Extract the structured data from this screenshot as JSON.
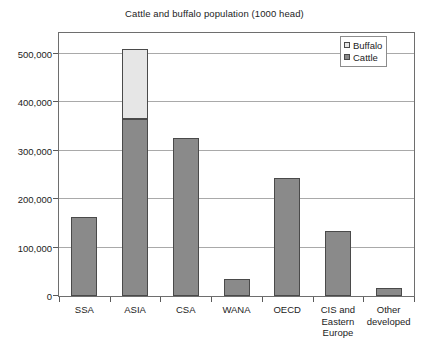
{
  "chart_data": {
    "type": "bar",
    "title": "Cattle and buffalo population (1000 head)",
    "xlabel": "",
    "ylabel": "",
    "ylim": [
      0,
      500000
    ],
    "ytick_labels": [
      "500,000",
      "400,000",
      "300,000",
      "200,000",
      "100,000",
      "0"
    ],
    "ytick_values": [
      500000,
      400000,
      300000,
      200000,
      100000,
      0
    ],
    "grid": true,
    "stacked": true,
    "legend_position": "top-right",
    "categories": [
      "SSA",
      "ASIA",
      "CSA",
      "WANA",
      "OECD",
      "CIS and Eastern Europe",
      "Other developed"
    ],
    "category_lines": [
      [
        "SSA"
      ],
      [
        "ASIA"
      ],
      [
        "CSA"
      ],
      [
        "WANA"
      ],
      [
        "OECD"
      ],
      [
        "CIS and",
        "Eastern",
        "Europe"
      ],
      [
        "Other",
        "developed"
      ]
    ],
    "series": [
      {
        "name": "Cattle",
        "color": "#8a8a8a",
        "values": [
          163000,
          365000,
          327000,
          35000,
          244000,
          134000,
          17000
        ]
      },
      {
        "name": "Buffalo",
        "color": "#e6e6e6",
        "values": [
          0,
          145000,
          0,
          0,
          0,
          0,
          0
        ]
      }
    ]
  },
  "legend": {
    "items": [
      {
        "label": "Buffalo",
        "color": "#e6e6e6"
      },
      {
        "label": "Cattle",
        "color": "#8a8a8a"
      }
    ]
  }
}
